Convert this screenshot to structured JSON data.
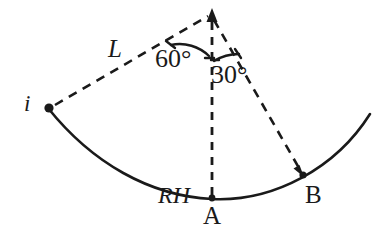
{
  "figure": {
    "background_color": "#ffffff",
    "ink_color": "#1a1a1a",
    "width": 392,
    "height": 250
  },
  "labels": {
    "length_L": "L",
    "point_i": "i",
    "angle_apex_left": "60°",
    "angle_apex_right": "30°",
    "point_RH": "RH",
    "point_A": "A",
    "point_B": "B"
  },
  "geometry": {
    "apex": {
      "x": 212,
      "y": 14
    },
    "point_i": {
      "x": 48,
      "y": 108
    },
    "point_A": {
      "x": 212,
      "y": 199
    },
    "point_B": {
      "x": 303,
      "y": 175
    },
    "arc": {
      "start": {
        "x": 48,
        "y": 108
      },
      "end": {
        "x": 370,
        "y": 114
      },
      "lowest": {
        "x": 212,
        "y": 200
      },
      "style": "solid"
    },
    "dashed_segments": [
      {
        "name": "i-to-apex",
        "from": "point_i",
        "to": "apex",
        "label": "L"
      },
      {
        "name": "apex-to-A",
        "from": "apex",
        "to": "point_A",
        "arrowhead": "up-at-apex"
      },
      {
        "name": "apex-to-B",
        "from": "apex",
        "to": "point_B",
        "arrowhead": "down-at-B"
      }
    ],
    "angle_arcs": [
      {
        "name": "60-degree",
        "between": [
          "i-to-apex",
          "apex-to-A"
        ],
        "value": "60°"
      },
      {
        "name": "30-degree",
        "between": [
          "apex-to-A",
          "apex-to-B"
        ],
        "value": "30°"
      }
    ],
    "dots": [
      "point_i",
      "point_A",
      "point_B"
    ]
  }
}
